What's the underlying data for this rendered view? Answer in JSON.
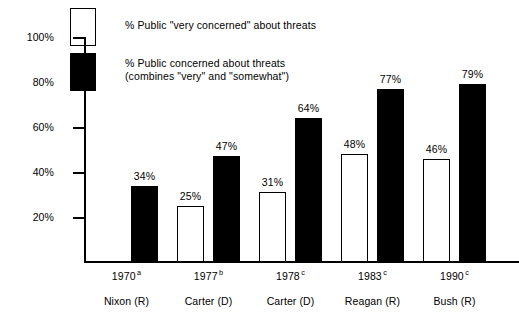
{
  "chart_data": {
    "type": "bar",
    "title": "",
    "xlabel": "",
    "ylabel": "",
    "ylim": [
      0,
      100
    ],
    "grid": false,
    "legend_position": "top-left",
    "categories": [
      "1970",
      "1977",
      "1978",
      "1983",
      "1990"
    ],
    "category_footnotes": [
      "a",
      "b",
      "c",
      "c",
      "c"
    ],
    "category_sublabels": [
      "Nixon (R)",
      "Carter (D)",
      "Carter (D)",
      "Reagan (R)",
      "Bush (R)"
    ],
    "tick_labels": [
      "100%",
      "80%",
      "60%",
      "40%",
      "20%"
    ],
    "tick_values": [
      100,
      80,
      60,
      40,
      20
    ],
    "series": [
      {
        "name": "% Public \"very concerned\" about threats",
        "style": "open",
        "values": [
          null,
          25,
          31,
          48,
          46
        ],
        "value_labels": [
          "",
          "25%",
          "31%",
          "48%",
          "46%"
        ]
      },
      {
        "name": "% Public concerned about threats (combines \"very\" and \"somewhat\")",
        "style": "filled",
        "values": [
          34,
          47,
          64,
          77,
          79
        ],
        "value_labels": [
          "34%",
          "47%",
          "64%",
          "77%",
          "79%"
        ]
      }
    ],
    "colors": {
      "open_bar_fill": "#ffffff",
      "open_bar_stroke": "#000000",
      "filled_bar_fill": "#000000",
      "axis": "#000000",
      "background": "#ffffff",
      "text": "#000000"
    }
  },
  "legend": {
    "items": [
      {
        "style": "open",
        "label": "% Public \"very concerned\" about threats"
      },
      {
        "style": "filled",
        "label": "% Public concerned about threats\n(combines \"very\" and \"somewhat\")"
      }
    ]
  }
}
